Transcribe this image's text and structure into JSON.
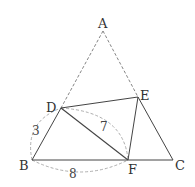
{
  "diagram": {
    "colors": {
      "line": "#444444",
      "dashed": "#888888",
      "arc": "#999999",
      "text": "#333333"
    },
    "points": {
      "A": {
        "label": "A",
        "x": 103,
        "y": 31
      },
      "B": {
        "label": "B",
        "x": 32,
        "y": 160
      },
      "C": {
        "label": "C",
        "x": 173,
        "y": 160
      },
      "D": {
        "label": "D",
        "x": 61,
        "y": 108
      },
      "E": {
        "label": "E",
        "x": 138,
        "y": 97
      },
      "F": {
        "label": "F",
        "x": 128,
        "y": 160
      }
    },
    "solid_segments": [
      "DB",
      "BC",
      "CE",
      "ED",
      "DF",
      "EF"
    ],
    "dashed_segments": [
      "AD",
      "AE"
    ],
    "measurements": [
      {
        "between": "BD",
        "value": "3"
      },
      {
        "between": "DF",
        "value": "7"
      },
      {
        "between": "BF",
        "value": "8"
      }
    ]
  }
}
